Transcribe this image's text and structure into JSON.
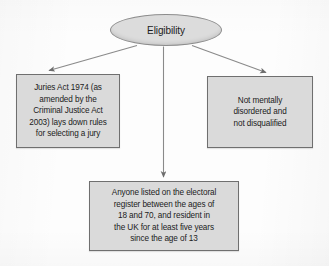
{
  "diagram": {
    "type": "flowchart",
    "title": "Eligibility",
    "colors": {
      "node_fill": "#dadada",
      "ellipse_fill": "#dcdcdc",
      "node_border": "#6f6f6f",
      "connector": "#8a8a8a",
      "text": "#1b1b1b",
      "background": "#fdfdfd"
    },
    "root": {
      "id": "eligibility",
      "shape": "ellipse",
      "label": "Eligibility"
    },
    "nodes": [
      {
        "id": "juries-act",
        "shape": "rectangle",
        "label": "Juries Act 1974 (as\namended by the\nCriminal Justice Act\n2003) lays down rules\nfor selecting a jury"
      },
      {
        "id": "electoral-register",
        "shape": "rectangle",
        "label": "Anyone listed on the electoral\nregister between the ages of\n18 and 70, and resident in\nthe UK for at least five years\nsince the age of 13"
      },
      {
        "id": "not-disqualified",
        "shape": "rectangle",
        "label": "Not mentally\ndisordered and\nnot disqualified"
      }
    ],
    "edges": [
      {
        "from": "eligibility",
        "to": "juries-act",
        "arrow": "single",
        "direction": "down-left"
      },
      {
        "from": "eligibility",
        "to": "electoral-register",
        "arrow": "single",
        "direction": "down"
      },
      {
        "from": "eligibility",
        "to": "not-disqualified",
        "arrow": "single",
        "direction": "down-right"
      }
    ]
  }
}
